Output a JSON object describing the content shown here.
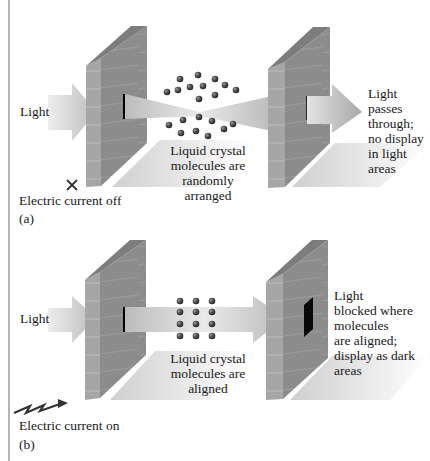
{
  "figure": {
    "panel_a": {
      "tag": "(a)",
      "input_label": "Light",
      "current_label": "Electric current off",
      "current_icon": "x-mark-icon",
      "molecule_caption": [
        "Liquid crystal",
        "molecules are",
        "randomly",
        "arranged"
      ],
      "output_caption": [
        "Light",
        "passes",
        "through;",
        "no display",
        "in light",
        "areas"
      ],
      "molecule_arrangement": "random",
      "display_state": "light"
    },
    "panel_b": {
      "tag": "(b)",
      "input_label": "Light",
      "current_label": "Electric current on",
      "current_icon": "lightning-bolt-icon",
      "molecule_caption": [
        "Liquid crystal",
        "molecules are",
        "aligned"
      ],
      "output_caption": [
        "Light",
        "blocked where",
        "molecules",
        "are aligned;",
        "display as dark",
        "areas"
      ],
      "molecule_arrangement": "grid-3x4",
      "display_state": "dark"
    },
    "colors": {
      "wall_face": "#8f8f8f",
      "wall_side": "#a9a9a9",
      "wall_top": "#7a7a7a",
      "beam": "#c8c8c8",
      "molecule": "#4a4a4a",
      "dark_pixel": "#0a0a0a",
      "shadow": "#d6d6d6"
    }
  }
}
